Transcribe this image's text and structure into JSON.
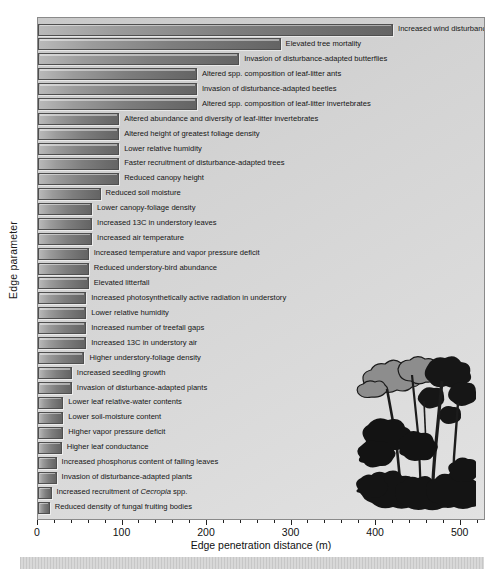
{
  "chart_data": {
    "type": "bar",
    "orientation": "horizontal",
    "title": "",
    "xlabel": "Edge penetration distance (m)",
    "ylabel": "Edge parameter",
    "xlim": [
      0,
      530
    ],
    "xticks": [
      0,
      100,
      200,
      300,
      400,
      500
    ],
    "xticklabels": [
      "0",
      "100",
      "200",
      "300",
      "400",
      "500"
    ],
    "grid": false,
    "legend": null,
    "categories": [
      "Increased wind disturbance",
      "Elevated tree mortality",
      "Invasion of disturbance-adapted butterflies",
      "Altered spp. composition of leaf-litter ants",
      "Invasion of disturbance-adapted beetles",
      "Altered spp. composition of leaf-litter invertebrates",
      "Altered abundance and diversity of leaf-litter invertebrates",
      "Altered height of greatest foliage density",
      "Lower relative humidity",
      "Faster recruitment of disturbance-adapted trees",
      "Reduced canopy height",
      "Reduced soil moisture",
      "Lower canopy-foliage density",
      "Increased 13C in understory leaves",
      "Increased air temperature",
      "Increased temperature and vapor pressure deficit",
      "Reduced understory-bird abundance",
      "Elevated litterfall",
      "Increased photosynthetically active radiation in understory",
      "Lower relative humidity",
      "Increased number of treefall gaps",
      "Increased 13C in understory air",
      "Higher understory-foliage density",
      "Increased seedling growth",
      "Invasion of disturbance-adapted plants",
      "Lower leaf relative-water contents",
      "Lower soil-moisture content",
      "Higher vapor pressure deficit",
      "Higher leaf conductance",
      "Increased phosphorus content of falling leaves",
      "Invasion of disturbance-adapted plants",
      "Increased recruitment of Cecropia spp.",
      "Reduced density of fungal fruiting bodies"
    ],
    "categories_html": [
      "Increased wind disturbance",
      "Elevated tree mortality",
      "Invasion of disturbance-adapted butterflies",
      "Altered spp. composition of leaf-litter ants",
      "Invasion of disturbance-adapted beetles",
      "Altered spp. composition of leaf-litter invertebrates",
      "Altered abundance and diversity of leaf-litter invertebrates",
      "Altered height of greatest foliage density",
      "Lower relative humidity",
      "Faster recruitment of disturbance-adapted trees",
      "Reduced canopy height",
      "Reduced soil moisture",
      "Lower canopy-foliage density",
      "Increased 13C in understory leaves",
      "Increased air temperature",
      "Increased temperature and vapor pressure deficit",
      "Reduced understory-bird abundance",
      "Elevated litterfall",
      "Increased photosynthetically active radiation in understory",
      "Lower relative humidity",
      "Increased number of treefall gaps",
      "Increased 13C in understory air",
      "Higher understory-foliage density",
      "Increased seedling growth",
      "Invasion of disturbance-adapted plants",
      "Lower leaf relative-water contents",
      "Lower soil-moisture content",
      "Higher vapor pressure deficit",
      "Higher leaf conductance",
      "Increased phosphorus content of falling leaves",
      "Invasion of disturbance-adapted plants",
      "Increased recruitment of <i>Cecropia</i> spp.",
      "Reduced density of fungal fruiting bodies"
    ],
    "values": [
      420,
      287,
      238,
      188,
      188,
      188,
      96,
      96,
      96,
      96,
      96,
      74,
      64,
      64,
      64,
      60,
      60,
      60,
      57,
      57,
      57,
      57,
      55,
      40,
      40,
      30,
      30,
      30,
      28,
      22,
      22,
      16,
      14
    ],
    "bar_color": "#7e7e7e",
    "bar_edge_color": "#4f4f4f",
    "plot_background": "#d6d6d6",
    "figure_background": "#ffffff"
  },
  "illustration": {
    "name": "cecropia-tree-illustration",
    "description": "Silhouette of Cecropia trees and understory ferns"
  }
}
